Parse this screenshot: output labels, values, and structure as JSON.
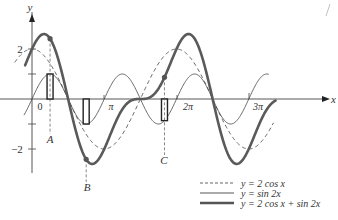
{
  "chart_data": {
    "type": "line",
    "title": "",
    "xlabel": "x",
    "ylabel": "y",
    "xlim": [
      -0.8,
      10.8
    ],
    "ylim": [
      -3,
      2.8
    ],
    "grid": false,
    "x_ticks": [
      {
        "value": 0,
        "label": "0"
      },
      {
        "value": 3.14159,
        "label": "π"
      },
      {
        "value": 6.28319,
        "label": "2π"
      },
      {
        "value": 9.42478,
        "label": "3π"
      }
    ],
    "y_ticks": [
      {
        "value": 2,
        "label": "2"
      },
      {
        "value": 1,
        "label": ""
      },
      {
        "value": -1,
        "label": ""
      },
      {
        "value": -2,
        "label": "−2"
      }
    ],
    "series": [
      {
        "name": "y = 2 cos x",
        "expr": "2cos(x)",
        "style": "dashed",
        "x_range": [
          -0.75,
          10.5
        ]
      },
      {
        "name": "y = sin 2x",
        "expr": "sin(2x)",
        "style": "thin",
        "x_range": [
          -0.35,
          10.3
        ]
      },
      {
        "name": "y = 2 cos x + sin 2x",
        "expr": "2cos(x)+sin(2x)",
        "style": "thick",
        "x_range": [
          -0.3,
          10.6
        ]
      }
    ],
    "annotations": [
      {
        "label": "A",
        "x": 0.785,
        "note": "ordinate addition at x=π/4"
      },
      {
        "label": "B",
        "x": 2.356,
        "note": "ordinate addition at x=3π/4, minimum of sum"
      },
      {
        "label": "C",
        "x": 5.76,
        "note": "ordinate addition near x=11π/6"
      }
    ],
    "legend": {
      "position": "bottom-right",
      "entries": [
        "y = 2 cos x",
        "y = sin 2x",
        "y = 2 cos x + sin 2x"
      ]
    }
  },
  "labels": {
    "x_axis": "x",
    "y_axis": "y",
    "origin": "0",
    "pi": "π",
    "two_pi": "2π",
    "three_pi": "3π",
    "y_two": "2",
    "y_neg_two": "−2",
    "point_a": "A",
    "point_b": "B",
    "point_c": "C"
  },
  "legend": [
    {
      "label": "y = 2 cos x",
      "style": "dashed"
    },
    {
      "label": "y = sin 2x",
      "style": "thin"
    },
    {
      "label": "y = 2 cos x + sin 2x",
      "style": "thick"
    }
  ],
  "colors": {
    "axis": "#444444",
    "sum_curve": "#5a5a5a",
    "thin_curve": "#444444",
    "dashed_curve": "#555555"
  }
}
